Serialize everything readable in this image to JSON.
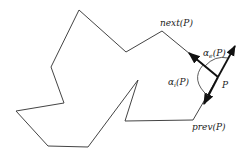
{
  "diagram": {
    "title": "",
    "polygon_points": "79,10 126,52 162,31 218,77 193,120 125,121 138,80 88,147 48,146 16,111 64,103 51,67",
    "stroke_color": "#333333",
    "labels": {
      "next": "next(P)",
      "prev": "prev(P)",
      "point": "P",
      "alpha_e_base": "α",
      "alpha_e_sub": "e",
      "alpha_e_arg": "(P)",
      "alpha_i_base": "α",
      "alpha_i_sub": "i",
      "alpha_i_arg": "(P)"
    }
  }
}
